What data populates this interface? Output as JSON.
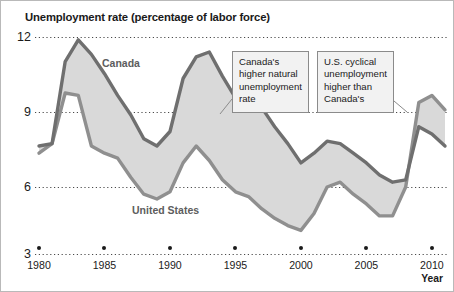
{
  "chart_data": {
    "type": "line",
    "title": "Unemployment rate (percentage of labor force)",
    "xlabel": "Year",
    "ylabel": "",
    "xlim": [
      1980,
      2011
    ],
    "ylim": [
      3,
      12
    ],
    "grid": true,
    "legend_position": "inline-labels",
    "yticks": [
      "12",
      "9",
      "6",
      "3"
    ],
    "ytick_values": [
      12,
      9,
      6,
      3
    ],
    "xticks": [
      "1980",
      "1985",
      "1990",
      "1995",
      "2000",
      "2005",
      "2010"
    ],
    "xtick_values": [
      1980,
      1985,
      1990,
      1995,
      2000,
      2005,
      2010
    ],
    "x": [
      1980,
      1981,
      1982,
      1983,
      1984,
      1985,
      1986,
      1987,
      1988,
      1989,
      1990,
      1991,
      1992,
      1993,
      1994,
      1995,
      1996,
      1997,
      1998,
      1999,
      2000,
      2001,
      2002,
      2003,
      2004,
      2005,
      2006,
      2007,
      2008,
      2009,
      2010,
      2011
    ],
    "series": [
      {
        "name": "Canada",
        "color": "#6f6f6f",
        "values": [
          7.5,
          7.6,
          11.0,
          11.9,
          11.3,
          10.5,
          9.6,
          8.8,
          7.8,
          7.5,
          8.1,
          10.3,
          11.2,
          11.4,
          10.4,
          9.5,
          9.6,
          9.1,
          8.3,
          7.6,
          6.8,
          7.2,
          7.7,
          7.6,
          7.2,
          6.8,
          6.3,
          6.0,
          6.1,
          8.3,
          8.0,
          7.5
        ]
      },
      {
        "name": "United States",
        "color": "#8f8f8f",
        "values": [
          7.2,
          7.6,
          9.7,
          9.6,
          7.5,
          7.2,
          7.0,
          6.2,
          5.5,
          5.3,
          5.6,
          6.8,
          7.5,
          6.9,
          6.1,
          5.6,
          5.4,
          4.9,
          4.5,
          4.2,
          4.0,
          4.7,
          5.8,
          6.0,
          5.5,
          5.1,
          4.6,
          4.6,
          5.8,
          9.3,
          9.6,
          9.0
        ]
      }
    ],
    "fill_between_color": "#d9d9d9",
    "annotations": [
      {
        "id": "canada-natural-rate",
        "text": "Canada's higher natural unemployment rate",
        "lines": [
          "Canada's",
          "higher natural",
          "unemployment",
          "rate"
        ]
      },
      {
        "id": "us-cyclical",
        "text": "U.S. cyclical unemployment higher than Canada's",
        "lines": [
          "U.S. cyclical",
          "unemployment",
          "higher than",
          "Canada's"
        ]
      }
    ]
  }
}
